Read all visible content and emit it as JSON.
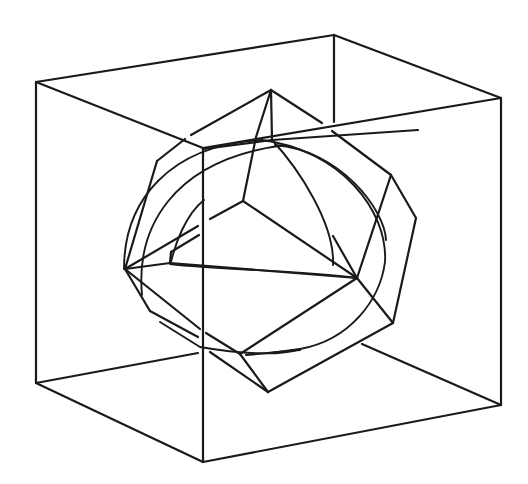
{
  "figure": {
    "stroke_color": "#1a1a1a",
    "background": "#ffffff"
  },
  "cube": {
    "edges": [
      [
        36,
        82,
        334,
        35
      ],
      [
        334,
        35,
        501,
        98
      ],
      [
        501,
        98,
        203,
        148
      ],
      [
        203,
        148,
        36,
        82
      ],
      [
        36,
        82,
        36,
        383
      ],
      [
        203,
        148,
        203,
        462
      ],
      [
        501,
        98,
        501,
        405
      ],
      [
        36,
        383,
        203,
        462
      ],
      [
        203,
        462,
        501,
        405
      ],
      [
        334,
        35,
        334,
        122
      ],
      [
        36,
        383,
        198,
        353
      ],
      [
        501,
        405,
        362,
        344
      ]
    ]
  },
  "polyhedron": {
    "edges": [
      [
        271,
        90,
        191,
        135
      ],
      [
        185,
        139,
        157,
        161
      ],
      [
        157,
        161,
        125,
        269
      ],
      [
        271,
        90,
        322,
        123
      ],
      [
        332,
        131,
        391,
        175
      ],
      [
        391,
        175,
        416,
        218
      ],
      [
        416,
        218,
        393,
        323
      ],
      [
        393,
        323,
        357,
        278
      ],
      [
        357,
        278,
        333,
        236
      ],
      [
        391,
        175,
        357,
        278
      ],
      [
        271,
        90,
        272,
        140
      ],
      [
        271,
        90,
        256,
        137
      ],
      [
        204,
        149,
        272,
        140
      ],
      [
        272,
        140,
        418,
        130
      ],
      [
        256,
        137,
        243,
        201
      ],
      [
        243,
        201,
        357,
        278
      ],
      [
        243,
        201,
        210,
        219
      ],
      [
        198,
        226,
        125,
        269
      ],
      [
        125,
        269,
        170,
        263
      ],
      [
        170,
        263,
        171,
        252
      ],
      [
        171,
        252,
        199,
        235
      ],
      [
        170,
        263,
        357,
        278
      ],
      [
        125,
        269,
        150,
        311
      ],
      [
        150,
        311,
        198,
        337
      ],
      [
        125,
        269,
        200,
        329
      ],
      [
        206,
        333,
        240,
        354
      ],
      [
        240,
        354,
        357,
        278
      ],
      [
        240,
        354,
        268,
        392
      ],
      [
        210,
        352,
        268,
        392
      ],
      [
        268,
        392,
        393,
        323
      ],
      [
        246,
        355,
        300,
        350
      ]
    ]
  },
  "sphere": {
    "arcs": [
      "M 124 269 C 124 200, 170 145, 262 140",
      "M 142 295 C 136 230, 170 160, 285 145",
      "M 275 145 C 340 150, 385 210, 386 240",
      "M 262 140 C 340 150, 388 210, 385 262 C 380 300, 350 340, 300 349 L 270 353",
      "M 272 140 C 300 170, 335 225, 333 265",
      "M 204 200 C 185 215, 175 245, 171 262",
      "M 300 349 C 280 356, 240 354, 200 347 L 160 322",
      "M 170 264 C 220 270, 300 270, 357 278"
    ]
  }
}
